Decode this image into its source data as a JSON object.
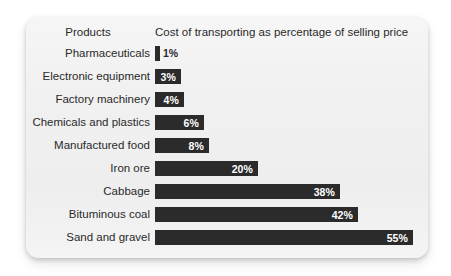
{
  "header": {
    "category_header": "Products",
    "value_header": "Cost of transporting as percentage of selling price"
  },
  "chart_data": {
    "type": "bar",
    "orientation": "horizontal",
    "title": "",
    "subtitle": "",
    "xlabel": "Cost of transporting as percentage of selling price",
    "ylabel": "Products",
    "categories": [
      "Pharmaceuticals",
      "Electronic equipment",
      "Factory machinery",
      "Chemicals and plastics",
      "Manufactured food",
      "Iron ore",
      "Cabbage",
      "Bituminous coal",
      "Sand and gravel"
    ],
    "values": [
      1,
      3,
      4,
      6,
      8,
      20,
      38,
      42,
      55
    ],
    "value_labels": [
      "1%",
      "3%",
      "4%",
      "6%",
      "8%",
      "20%",
      "38%",
      "42%",
      "55%"
    ],
    "units": "percent",
    "xlim": [
      0,
      55
    ],
    "grid": false,
    "legend": false,
    "bar_color": "#2b2b2b",
    "card_color": "#f1f1f1",
    "label_color": "#2a2a2a"
  },
  "rows": [
    {
      "label": "Pharmaceuticals",
      "value": 1,
      "value_label": "1%",
      "bar_px": 5,
      "label_inside": false
    },
    {
      "label": "Electronic equipment",
      "value": 3,
      "value_label": "3%",
      "bar_px": 26,
      "label_inside": true
    },
    {
      "label": "Factory machinery",
      "value": 4,
      "value_label": "4%",
      "bar_px": 29,
      "label_inside": true
    },
    {
      "label": "Chemicals and plastics",
      "value": 6,
      "value_label": "6%",
      "bar_px": 49,
      "label_inside": true
    },
    {
      "label": "Manufactured food",
      "value": 8,
      "value_label": "8%",
      "bar_px": 54,
      "label_inside": true
    },
    {
      "label": "Iron ore",
      "value": 20,
      "value_label": "20%",
      "bar_px": 103,
      "label_inside": true
    },
    {
      "label": "Cabbage",
      "value": 38,
      "value_label": "38%",
      "bar_px": 185,
      "label_inside": true
    },
    {
      "label": "Bituminous coal",
      "value": 42,
      "value_label": "42%",
      "bar_px": 203,
      "label_inside": true
    },
    {
      "label": "Sand and gravel",
      "value": 55,
      "value_label": "55%",
      "bar_px": 258,
      "label_inside": true
    }
  ]
}
